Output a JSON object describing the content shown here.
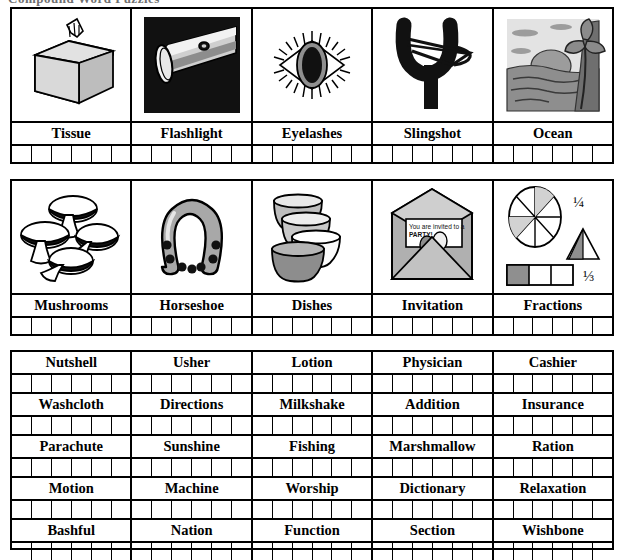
{
  "worksheet": {
    "header": "Compound Word Puzzles",
    "letter_boxes_per_cell": 6
  },
  "picture_rows": [
    {
      "row_index": 1,
      "cells": [
        {
          "word": "Tissue",
          "icon": "tissue-box-icon"
        },
        {
          "word": "Flashlight",
          "icon": "flashlight-icon"
        },
        {
          "word": "Eyelashes",
          "icon": "eye-with-lashes-icon"
        },
        {
          "word": "Slingshot",
          "icon": "slingshot-icon"
        },
        {
          "word": "Ocean",
          "icon": "ocean-sunset-palm-icon"
        }
      ]
    },
    {
      "row_index": 2,
      "cells": [
        {
          "word": "Mushrooms",
          "icon": "mushrooms-icon"
        },
        {
          "word": "Horseshoe",
          "icon": "horseshoe-icon"
        },
        {
          "word": "Dishes",
          "icon": "stacked-bowls-icon"
        },
        {
          "word": "Invitation",
          "icon": "open-envelope-invitation-icon"
        },
        {
          "word": "Fractions",
          "icon": "fractions-diagram-icon"
        }
      ]
    }
  ],
  "invitation_card": {
    "line1": "You are invited to a",
    "line2": "PARTY!"
  },
  "fractions_labels": {
    "quarter": "1/4",
    "third": "1/3",
    "pie_slices": 8,
    "bar_parts": 3
  },
  "word_rows": [
    {
      "row_index": 3,
      "words": [
        "Nutshell",
        "Usher",
        "Lotion",
        "Physician",
        "Cashier"
      ]
    },
    {
      "row_index": 4,
      "words": [
        "Washcloth",
        "Directions",
        "Milkshake",
        "Addition",
        "Insurance"
      ]
    },
    {
      "row_index": 5,
      "words": [
        "Parachute",
        "Sunshine",
        "Fishing",
        "Marshmallow",
        "Ration"
      ]
    },
    {
      "row_index": 6,
      "words": [
        "Motion",
        "Machine",
        "Worship",
        "Dictionary",
        "Relaxation"
      ]
    },
    {
      "row_index": 7,
      "words": [
        "Bashful",
        "Nation",
        "Function",
        "Section",
        "Wishbone"
      ]
    }
  ],
  "colors": {
    "ink": "#000000",
    "paper": "#ffffff",
    "gray_light": "#d4d4d4",
    "gray_mid": "#9a9a9a",
    "gray_dark": "#555555"
  }
}
